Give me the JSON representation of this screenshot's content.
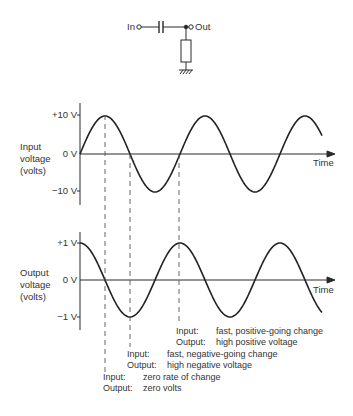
{
  "circuit": {
    "in_label": "In",
    "out_label": "Out",
    "components": [
      "capacitor",
      "resistor",
      "ground"
    ]
  },
  "input_graph": {
    "ylabel": [
      "Input",
      "voltage",
      "(volts)"
    ],
    "ticks": [
      "+10 V",
      "0 V",
      "−10 V"
    ],
    "xlabel": "Time"
  },
  "output_graph": {
    "ylabel": [
      "Output",
      "voltage",
      "(volts)"
    ],
    "ticks": [
      "+1 V",
      "0 V",
      "−1 V"
    ],
    "xlabel": "Time"
  },
  "annotations": [
    {
      "input_key": "Input:",
      "input_text": "fast, positive-going change",
      "output_key": "Output:",
      "output_text": "high positive voltage"
    },
    {
      "input_key": "Input:",
      "input_text": "fast, negative-going change",
      "output_key": "Output:",
      "output_text": "high negative voltage"
    },
    {
      "input_key": "Input:",
      "input_text": "zero rate of change",
      "output_key": "Output:",
      "output_text": "zero volts"
    }
  ],
  "chart_data": [
    {
      "type": "line",
      "title": "Input voltage (sine)",
      "ylabel": "Input voltage (volts)",
      "xlabel": "Time",
      "ylim": [
        -10,
        10
      ],
      "series": [
        {
          "name": "input",
          "function": "10*sin(t)",
          "cycles": 2.5
        }
      ]
    },
    {
      "type": "line",
      "title": "Output voltage (differentiated, cosine)",
      "ylabel": "Output voltage (volts)",
      "xlabel": "Time",
      "ylim": [
        -1,
        1
      ],
      "series": [
        {
          "name": "output",
          "function": "1*cos(t)",
          "cycles": 2.5
        }
      ]
    }
  ]
}
